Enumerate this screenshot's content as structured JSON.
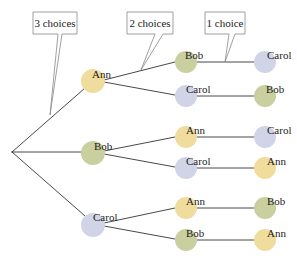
{
  "colors": {
    "ann": "#f0dc9c",
    "bob": "#c9cf9f",
    "carol": "#d1d3e6",
    "line": "#333333",
    "callout_border": "#888888"
  },
  "callouts": [
    {
      "label": "3 choices"
    },
    {
      "label": "2 choices"
    },
    {
      "label": "1 choice"
    }
  ],
  "tree": {
    "level1": [
      {
        "name": "Ann",
        "children": [
          {
            "name": "Bob",
            "leaf": "Carol"
          },
          {
            "name": "Carol",
            "leaf": "Bob"
          }
        ]
      },
      {
        "name": "Bob",
        "children": [
          {
            "name": "Ann",
            "leaf": "Carol"
          },
          {
            "name": "Carol",
            "leaf": "Ann"
          }
        ]
      },
      {
        "name": "Carol",
        "children": [
          {
            "name": "Ann",
            "leaf": "Bob"
          },
          {
            "name": "Bob",
            "leaf": "Ann"
          }
        ]
      }
    ]
  }
}
